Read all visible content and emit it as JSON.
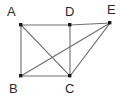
{
  "figure": {
    "background_color": "#ffffff",
    "line_color": "#6e6e6e",
    "label_color": "#2b2b2b",
    "vertex_color": "#1a1a1a",
    "vertices": [
      {
        "id": "A",
        "label": "A",
        "x": 21,
        "y": 25,
        "label_x": 7,
        "label_y": 5
      },
      {
        "id": "D",
        "label": "D",
        "x": 70,
        "y": 25,
        "label_x": 65,
        "label_y": 5
      },
      {
        "id": "E",
        "label": "E",
        "x": 110,
        "y": 23,
        "label_x": 107,
        "label_y": 3
      },
      {
        "id": "B",
        "label": "B",
        "x": 21,
        "y": 76,
        "label_x": 9,
        "label_y": 82
      },
      {
        "id": "C",
        "label": "C",
        "x": 70,
        "y": 76,
        "label_x": 65,
        "label_y": 82
      }
    ],
    "edges": [
      {
        "id": "AD",
        "from": "A",
        "to": "D",
        "x1": 21,
        "y1": 25,
        "x2": 70,
        "y2": 25
      },
      {
        "id": "DE",
        "from": "D",
        "to": "E",
        "x1": 70,
        "y1": 25,
        "x2": 110,
        "y2": 23
      },
      {
        "id": "AB",
        "from": "A",
        "to": "B",
        "x1": 21,
        "y1": 25,
        "x2": 21,
        "y2": 76
      },
      {
        "id": "BC",
        "from": "B",
        "to": "C",
        "x1": 21,
        "y1": 76,
        "x2": 70,
        "y2": 76
      },
      {
        "id": "DC",
        "from": "D",
        "to": "C",
        "x1": 70,
        "y1": 25,
        "x2": 70,
        "y2": 76
      },
      {
        "id": "AC",
        "from": "A",
        "to": "C",
        "x1": 21,
        "y1": 25,
        "x2": 70,
        "y2": 76
      },
      {
        "id": "BE",
        "from": "B",
        "to": "E",
        "x1": 21,
        "y1": 76,
        "x2": 110,
        "y2": 23
      },
      {
        "id": "CE",
        "from": "C",
        "to": "E",
        "x1": 70,
        "y1": 76,
        "x2": 110,
        "y2": 23
      }
    ]
  }
}
